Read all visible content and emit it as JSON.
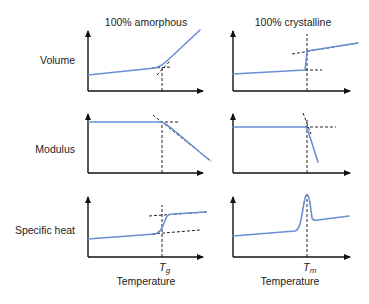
{
  "columns": {
    "amorphous": "100% amorphous",
    "crystalline": "100% crystalline"
  },
  "rows": {
    "volume": "Volume",
    "modulus": "Modulus",
    "specific_heat": "Specific heat"
  },
  "x_axis": {
    "amorphous_label": "Temperature",
    "crystalline_label": "Temperature",
    "tg_symbol": "T",
    "tg_sub": "g",
    "tm_symbol": "T",
    "tm_sub": "m"
  },
  "colors": {
    "curve": "#6b8fd4",
    "axis": "#111111"
  }
}
